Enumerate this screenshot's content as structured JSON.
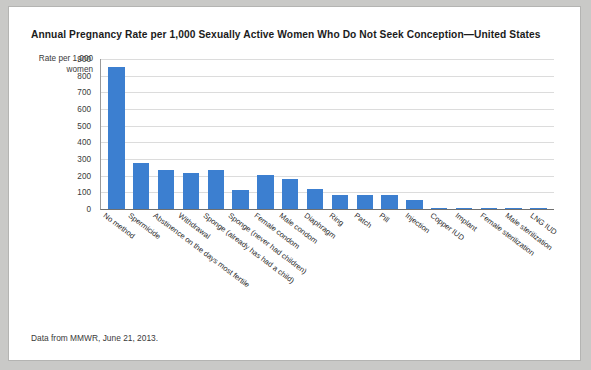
{
  "card": {
    "footnote": "Data from MMWR, June 21, 2013."
  },
  "chart_data": {
    "type": "bar",
    "title": "Annual Pregnancy Rate per 1,000 Sexually Active Women Who Do Not Seek Conception—United States",
    "xlabel": "",
    "ylabel": "Rate per 1,000 women",
    "ylim": [
      0,
      900
    ],
    "yticks": [
      900,
      800,
      700,
      600,
      500,
      400,
      300,
      200,
      100,
      0
    ],
    "grid": true,
    "legend": "none",
    "bar_color": "#3c7fd0",
    "categories": [
      "No method",
      "Spermicide",
      "Abstinence on the days most fertile",
      "Withdrawal",
      "Sponge (already has had a child)",
      "Sponge (never had children)",
      "Female condom",
      "Male condom",
      "Diaphragm",
      "Ring",
      "Patch",
      "Pill",
      "Injection",
      "Copper IUD",
      "Implant",
      "Female sterilization",
      "Male sterilization",
      "LNG IUD"
    ],
    "values": [
      850,
      275,
      235,
      215,
      235,
      115,
      205,
      180,
      120,
      85,
      85,
      85,
      55,
      8,
      5,
      5,
      5,
      2
    ]
  }
}
